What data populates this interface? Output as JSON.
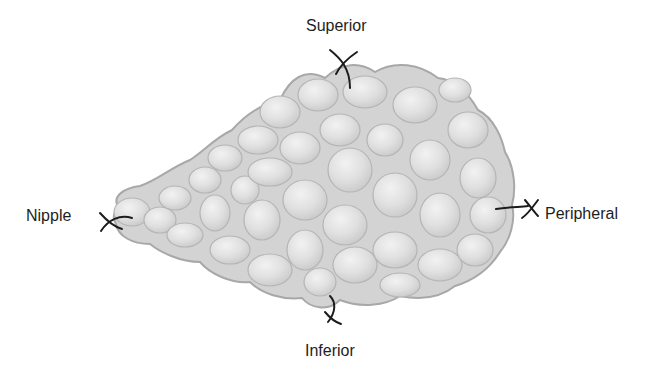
{
  "diagram": {
    "labels": {
      "superior": "Superior",
      "nipple": "Nipple",
      "peripheral": "Peripheral",
      "inferior": "Inferior"
    },
    "colors": {
      "tissue_fill": "#d6d6d6",
      "tissue_lobule": "#e2e2e2",
      "tissue_outline": "#a8a8a8",
      "suture": "#1c1c1c",
      "text": "#1e1e1e"
    }
  }
}
